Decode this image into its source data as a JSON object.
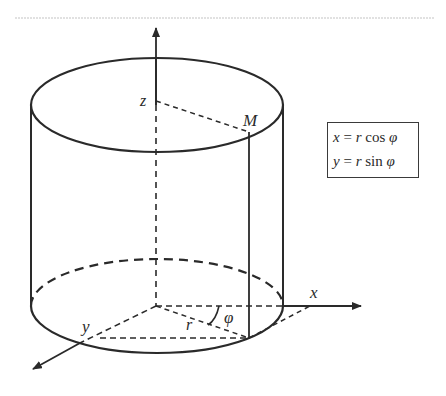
{
  "diagram": {
    "axes": {
      "z_label": "z",
      "x_label": "x",
      "y_label": "y"
    },
    "point_label": "M",
    "radius_label": "r",
    "angle_label": "φ",
    "z_marker_label": "z",
    "formulas": [
      {
        "lhs": "x",
        "eq": " = ",
        "r": "r",
        "fn": " cos ",
        "phi": "φ"
      },
      {
        "lhs": "y",
        "eq": " = ",
        "r": "r",
        "fn": " sin ",
        "phi": "φ"
      }
    ],
    "colors": {
      "stroke": "#2a2a2a",
      "faint_rule": "#d8d8d8",
      "background": "#ffffff"
    }
  }
}
